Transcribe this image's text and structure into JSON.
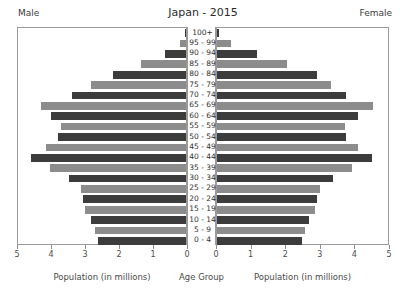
{
  "header": {
    "title": "Japan - 2015",
    "male_label": "Male",
    "female_label": "Female"
  },
  "captions": {
    "left": "Population (in millions)",
    "center": "Age Group",
    "right": "Population (in millions)"
  },
  "colors": {
    "bar_dark": "#3c3c3c",
    "bar_light": "#8c8c8c",
    "background": "#ffffff",
    "axis": "#9a9a9a",
    "text": "#3c3c3c"
  },
  "chart_data": {
    "type": "bar",
    "title": "Japan - 2015",
    "subtitle": "",
    "orientation": "horizontal",
    "layout": "population-pyramid",
    "xlabel": "Population (in millions)",
    "ylabel": "Age Group",
    "grid": false,
    "legend_position": "none",
    "left_axis_label": "Male",
    "right_axis_label": "Female",
    "left_xlim": [
      5,
      0
    ],
    "right_xlim": [
      0,
      5
    ],
    "xticks": [
      0,
      1,
      2,
      3,
      4,
      5
    ],
    "left_tick_labels": [
      "5",
      "4",
      "3",
      "2",
      "1",
      "0"
    ],
    "right_tick_labels": [
      "0",
      "1",
      "2",
      "3",
      "4",
      "5"
    ],
    "categories": [
      "0 - 4",
      "5 - 9",
      "10 - 14",
      "15 - 19",
      "20 - 24",
      "25 - 29",
      "30 - 34",
      "35 - 39",
      "40 - 44",
      "45 - 49",
      "50 - 54",
      "55 - 59",
      "60 - 64",
      "65 - 69",
      "70 - 74",
      "75 - 79",
      "80 - 84",
      "85 - 89",
      "90 - 94",
      "95 - 99",
      "100+"
    ],
    "series": [
      {
        "name": "Male",
        "side": "left",
        "values": [
          2.62,
          2.7,
          2.83,
          3.01,
          3.08,
          3.12,
          3.48,
          4.05,
          4.61,
          4.18,
          3.8,
          3.72,
          4.03,
          4.32,
          3.39,
          2.82,
          2.17,
          1.34,
          0.62,
          0.17,
          0.02
        ]
      },
      {
        "name": "Female",
        "side": "right",
        "values": [
          2.49,
          2.57,
          2.69,
          2.86,
          2.93,
          3.0,
          3.38,
          3.96,
          4.52,
          4.11,
          3.77,
          3.74,
          4.12,
          4.56,
          3.76,
          3.33,
          2.92,
          2.06,
          1.18,
          0.42,
          0.06
        ]
      }
    ]
  }
}
